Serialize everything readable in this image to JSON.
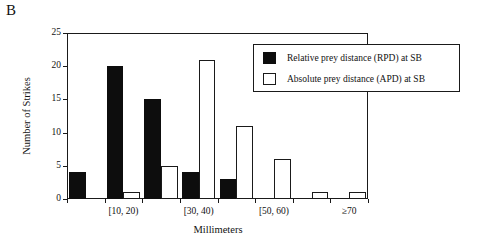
{
  "panel": {
    "label": "B"
  },
  "chart_data": {
    "type": "bar",
    "title": "",
    "xlabel": "Millimeters",
    "ylabel": "Number of Strikes",
    "ylim": [
      0,
      25
    ],
    "yticks": [
      0,
      5,
      10,
      15,
      20,
      25
    ],
    "ytick_labels": [
      "0",
      "5",
      "10",
      "15",
      "20",
      "25"
    ],
    "grid": false,
    "legend_position": "top-right",
    "categories": [
      "[0, 10)",
      "[10, 20)",
      "[20, 30)",
      "[30, 40)",
      "[40, 50)",
      "[50, 60)",
      "[60, 70)",
      "≥70"
    ],
    "xtick_labels": [
      "[10, 20)",
      "[30, 40)",
      "[50, 60)",
      "≥70"
    ],
    "xtick_label_categories": [
      "[10, 20)",
      "[30, 40)",
      "[50, 60)",
      "≥70"
    ],
    "series": [
      {
        "name": "Relative prey distance (RPD) at SB",
        "color": "#0d0d0d",
        "fill": "solid",
        "values": [
          4,
          20,
          15,
          4,
          3,
          0,
          0,
          0
        ]
      },
      {
        "name": "Absolute prey distance (APD) at SB",
        "color": "#ffffff",
        "fill": "open",
        "values": [
          0,
          1,
          5,
          21,
          11,
          6,
          1,
          1
        ]
      }
    ]
  },
  "legend": {
    "items": [
      {
        "label": "Relative prey distance (RPD) at SB",
        "swatch": "filled-black"
      },
      {
        "label": "Absolute prey distance (APD) at SB",
        "swatch": "open-white"
      }
    ]
  }
}
